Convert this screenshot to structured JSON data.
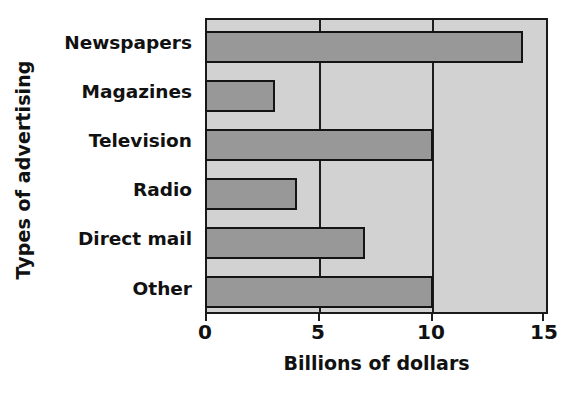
{
  "chart_data": {
    "type": "bar",
    "orientation": "horizontal",
    "title": "",
    "xlabel": "Billions of dollars",
    "ylabel": "Types of advertising",
    "categories": [
      "Newspapers",
      "Magazines",
      "Television",
      "Radio",
      "Direct mail",
      "Other"
    ],
    "values": [
      14,
      3,
      10,
      4,
      7,
      10
    ],
    "xlim": [
      0,
      15
    ],
    "xticks": [
      0,
      5,
      10,
      15
    ],
    "xtick_labels": [
      "0",
      "5",
      "10",
      "15"
    ],
    "grid": true,
    "gridlines_at": [
      5,
      10
    ],
    "legend": null,
    "colors": {
      "bar_fill": "#989898",
      "bar_edge": "#141414",
      "plot_background": "#d2d2d2",
      "axis": "#1a1a1a",
      "text": "#111111",
      "page_background": "#ffffff"
    }
  }
}
